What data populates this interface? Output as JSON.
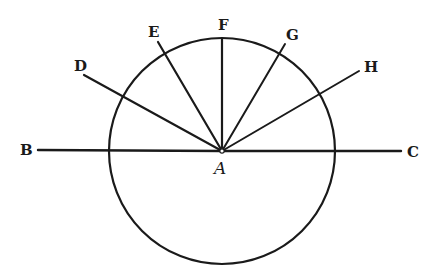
{
  "figure": {
    "type": "geometric diagram",
    "stroke_color": "#1a1a1a",
    "background": "#ffffff",
    "circle": {
      "cx": 222,
      "cy": 151,
      "r": 113
    },
    "center": {
      "label": "A",
      "x": 222,
      "y": 151
    },
    "lines": [
      {
        "id": "AB",
        "label": "B",
        "x1": 222,
        "y1": 151,
        "x2": 38,
        "y2": 150,
        "label_x": 20,
        "label_y": 155
      },
      {
        "id": "AC",
        "label": "C",
        "x1": 222,
        "y1": 151,
        "x2": 401,
        "y2": 151,
        "label_x": 407,
        "label_y": 157
      },
      {
        "id": "AD",
        "label": "D",
        "x1": 222,
        "y1": 151,
        "x2": 84,
        "y2": 75,
        "label_x": 74,
        "label_y": 71
      },
      {
        "id": "AE",
        "label": "E",
        "x1": 222,
        "y1": 151,
        "x2": 158,
        "y2": 42,
        "label_x": 148,
        "label_y": 37
      },
      {
        "id": "AF",
        "label": "F",
        "x1": 222,
        "y1": 151,
        "x2": 222,
        "y2": 39,
        "label_x": 218,
        "label_y": 30
      },
      {
        "id": "AG",
        "label": "G",
        "x1": 222,
        "y1": 151,
        "x2": 285,
        "y2": 44,
        "label_x": 286,
        "label_y": 40
      },
      {
        "id": "AH",
        "label": "H",
        "x1": 222,
        "y1": 151,
        "x2": 359,
        "y2": 71,
        "label_x": 364,
        "label_y": 72
      }
    ],
    "labels": [
      "B",
      "C",
      "D",
      "E",
      "F",
      "G",
      "H",
      "A"
    ]
  }
}
